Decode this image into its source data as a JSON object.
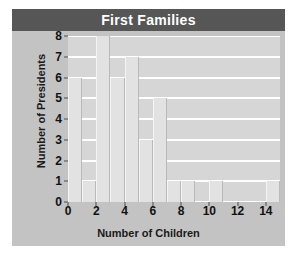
{
  "figure": {
    "background": "#ffffff",
    "panel_background": "#c3c3c3",
    "plot_background": "#d6d6d6"
  },
  "title": {
    "text": "First Families",
    "background": "#565656",
    "color": "#ffffff"
  },
  "chart_data": {
    "type": "bar",
    "title": "First Families",
    "xlabel": "Number of Children",
    "ylabel": "Number of Presidents",
    "categories": [
      0,
      1,
      2,
      3,
      4,
      5,
      6,
      7,
      8,
      9,
      10,
      11,
      12,
      13,
      14
    ],
    "values": [
      6,
      1,
      8,
      6,
      7,
      3,
      5,
      1,
      1,
      0,
      1,
      0,
      0,
      0,
      1
    ],
    "x": [
      0,
      1,
      2,
      3,
      4,
      5,
      6,
      7,
      8,
      9,
      10,
      11,
      12,
      13,
      14
    ],
    "xlim": [
      0,
      15
    ],
    "ylim": [
      0,
      8
    ],
    "xticks": [
      0,
      2,
      4,
      6,
      8,
      10,
      12,
      14
    ],
    "xtick_labels": [
      "0",
      "2",
      "4",
      "6",
      "8",
      "10",
      "12",
      "14"
    ],
    "yticks": [
      0,
      1,
      2,
      3,
      4,
      5,
      6,
      7,
      8
    ],
    "ytick_labels": [
      "0",
      "1",
      "2",
      "3",
      "4",
      "5",
      "6",
      "7",
      "8"
    ],
    "grid": true,
    "grid_axis": "y",
    "grid_color": "#ffffff",
    "bar_color": "#e2e2e2",
    "legend": null,
    "annotations": []
  },
  "axes": {
    "x_title": "Number of Children",
    "y_title": "Number of Presidents"
  }
}
